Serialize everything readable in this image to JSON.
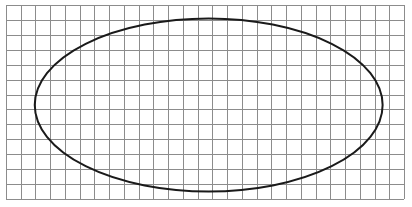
{
  "diagram": {
    "type": "grid-with-ellipse",
    "grid": {
      "columns": 27,
      "rows": 13,
      "line_color": "#8c8c8c",
      "border_color": "#8c8c8c",
      "background": "#ffffff"
    },
    "ellipse": {
      "center_cell": [
        13.75,
        6.7
      ],
      "radius_cells": [
        11.8,
        5.8
      ],
      "stroke_color": "#1a1a1a",
      "fill": "none"
    }
  }
}
